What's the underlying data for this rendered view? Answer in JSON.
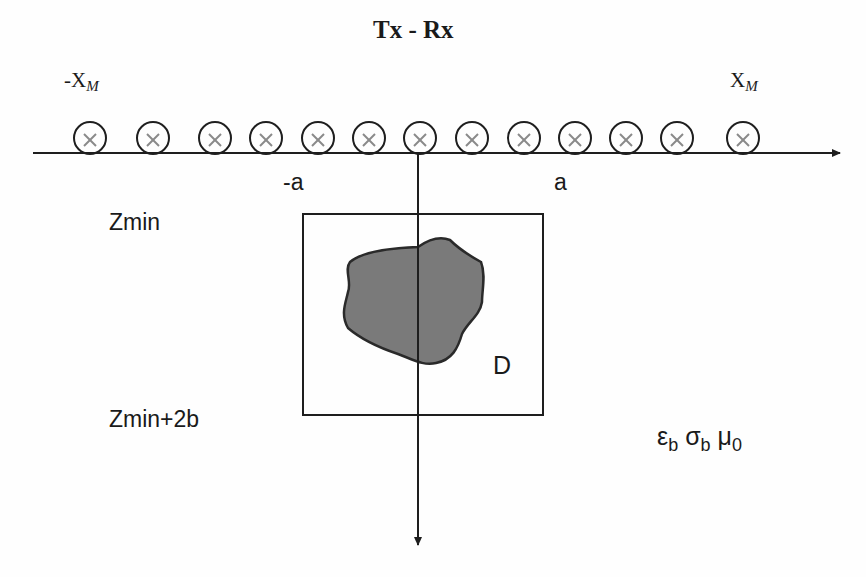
{
  "title": "Tx - Rx",
  "labels": {
    "neg_xm_base": "-X",
    "neg_xm_sub": "M",
    "pos_xm_base": "X",
    "pos_xm_sub": "M",
    "neg_a": "-a",
    "pos_a": "a",
    "zmin": "Zmin",
    "zmin_2b": "Zmin+2b",
    "domain": "D"
  },
  "medium": {
    "eps": "ε",
    "eps_sub": "b",
    "sigma": "σ",
    "sigma_sub": "b",
    "mu": "μ",
    "mu_sub": "0"
  },
  "antennas": {
    "count": 13,
    "x_positions": [
      90,
      153,
      215,
      266,
      318,
      369,
      420,
      472,
      524,
      575,
      626,
      677,
      743
    ],
    "y": 138,
    "radius": 16,
    "symbol": "x"
  },
  "colors": {
    "line": "#1e1e1e",
    "scatterer_fill": "#7a7a7a",
    "scatterer_edge": "#2a2a2a",
    "antenna_x": "#8a8a8a"
  }
}
